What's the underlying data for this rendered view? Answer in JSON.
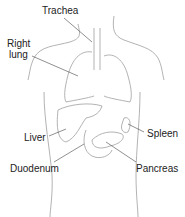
{
  "diagram": {
    "labels": {
      "trachea": "Trachea",
      "right_lung_line1": "Right",
      "right_lung_line2": "lung",
      "liver": "Liver",
      "spleen": "Spleen",
      "duodenum": "Duodenum",
      "pancreas": "Pancreas"
    },
    "colors": {
      "outline": "#9a9a9a",
      "leader": "#444444",
      "text": "#222222"
    }
  }
}
